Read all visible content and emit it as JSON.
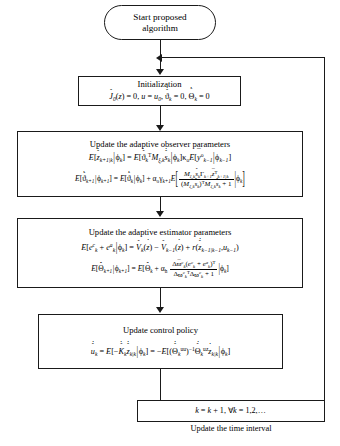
{
  "diagram": {
    "line_color": "#1a1a1a",
    "background": "#ffffff"
  },
  "nodes": {
    "start": {
      "name": "start-terminator",
      "line1": "Start proposed",
      "line2": "algorithm"
    },
    "initialization": {
      "name": "initialization-box",
      "title": "Initialization",
      "equation": "J̈0(z) = 0, u = u0, ϑ̂̇k = 0, Θ̃̇k = 0"
    },
    "observer": {
      "name": "observer-update-box",
      "title": "Update the adaptive observer parameters",
      "equation1": "E[ẑ̇k+1|k | ϕk] = E[ϑ̂̇kT Mξ,k ŝ̇k | ϕk] κo E[ȳok-1 | ϕk-1]",
      "equation2": "E[ϑ̂̇k+1 | ϕk+1] = E[ϑ̂̇k | ϕk] + αo γk+1 E[ Mξ,k ŝ̇k Γk+1 z̄̇Tk+1|k / ((Mξ,k ŝ̇k)T Mξ,k ŝ̇k + 1) | ϕk]"
    },
    "estimator": {
      "name": "estimator-update-box",
      "title": "Update the adaptive estimator parameters",
      "equation1": "E[eck + eak | ϕk] = V̂k(ż) − V̂k-1(ż) + r(ẑ̇k-1|k-1, uk-1)",
      "equation2": "E[Θ̃̇k+1 | ϕk+1] = E[Θ̃̇k + αh Δϖ̄ck (eck + eak)T / (Δϖ̄ckT Δϖ̄ck + 1) | ϕk]"
    },
    "control": {
      "name": "control-policy-box",
      "title": "Update control policy",
      "equation": "û̇k = E[−K̂̇k ẑ̇k|k | ϕk] = −E[(Θ̂̇uuk)−1 Θ̂̇uzk żk|k | ϕk]"
    },
    "increment": {
      "name": "time-increment-box",
      "equation": "k = k + 1, ∀k = 1,2,…"
    }
  },
  "labels": {
    "update_time_interval": "Update the time interval"
  },
  "connectors": [
    {
      "name": "start-to-initialization",
      "type": "arrow-down"
    },
    {
      "name": "initialization-to-observer",
      "type": "arrow-down"
    },
    {
      "name": "observer-to-estimator",
      "type": "arrow-down"
    },
    {
      "name": "estimator-to-control",
      "type": "arrow-down"
    },
    {
      "name": "control-to-increment",
      "type": "line"
    },
    {
      "name": "feedback-loop-to-initialization",
      "type": "arrow-left"
    }
  ]
}
